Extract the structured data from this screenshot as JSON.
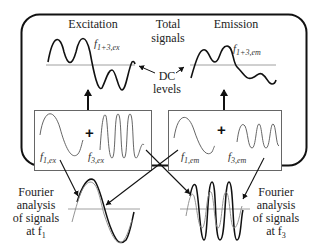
{
  "labels": {
    "excitation": "Excitation",
    "total_signals_line1": "Total",
    "total_signals_line2": "signals",
    "emission": "Emission",
    "dc_line1": "DC",
    "dc_line2": "levels",
    "plus": "+",
    "f_prefix": "f",
    "sub_13ex": "1+3,ex",
    "sub_13em": "1+3,em",
    "sub_1ex": "1,ex",
    "sub_3ex": "3,ex",
    "sub_1em": "1,em",
    "sub_3em": "3,em",
    "fourier_left": [
      "Fourier",
      "analysis",
      "of signals",
      "at f"
    ],
    "fourier_left_sub": "1",
    "fourier_right": [
      "Fourier",
      "analysis",
      "of signals",
      "at f"
    ],
    "fourier_right_sub": "3"
  },
  "colors": {
    "stroke_dark": "#111111",
    "stroke_mid": "#444444",
    "stroke_light": "#888888",
    "box_border": "#666666"
  }
}
